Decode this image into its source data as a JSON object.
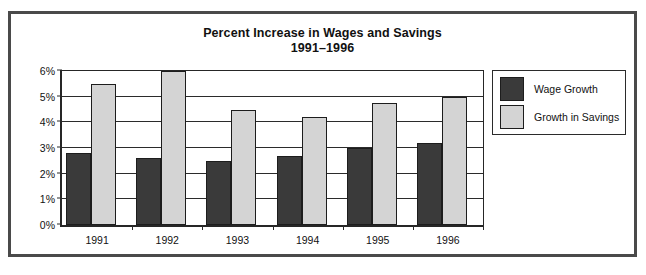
{
  "chart_data": {
    "type": "bar",
    "title": "Percent Increase in Wages and Savings",
    "subtitle": "1991–1996",
    "xlabel": "",
    "ylabel": "",
    "categories": [
      "1991",
      "1992",
      "1993",
      "1994",
      "1995",
      "1996"
    ],
    "series": [
      {
        "name": "Wage Growth",
        "color": "#3a3a3a",
        "values": [
          2.8,
          2.6,
          2.5,
          2.7,
          3.0,
          3.2
        ]
      },
      {
        "name": "Growth in Savings",
        "color": "#d4d4d4",
        "values": [
          5.5,
          6.0,
          4.5,
          4.2,
          4.75,
          5.0
        ]
      }
    ],
    "ylim": [
      0,
      6
    ],
    "ytick_values": [
      0,
      1,
      2,
      3,
      4,
      5,
      6
    ],
    "ytick_labels": [
      "0%",
      "1%",
      "2%",
      "3%",
      "4%",
      "5%",
      "6%"
    ],
    "grid": true,
    "legend_position": "right-outside"
  },
  "legend": {
    "entries": [
      {
        "label": "Wage Growth",
        "swatch": "dark-gray-swatch"
      },
      {
        "label": "Growth in Savings",
        "swatch": "light-gray-swatch"
      }
    ]
  }
}
